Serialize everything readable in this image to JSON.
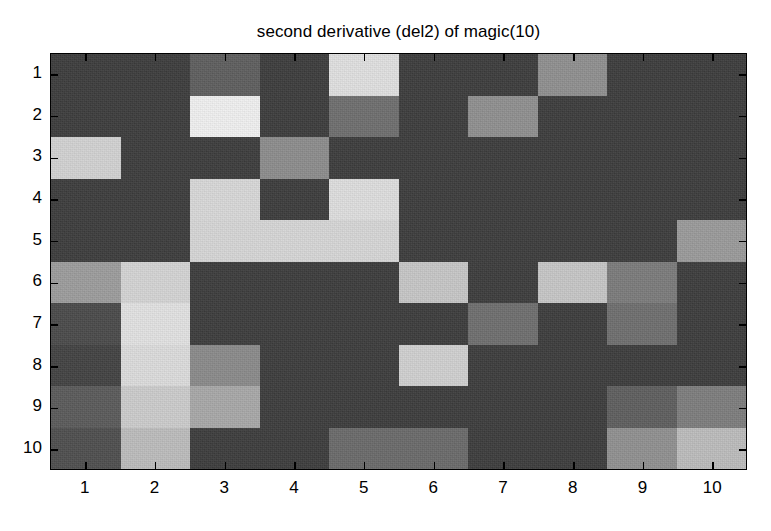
{
  "figure": {
    "title": "second derivative (del2) of magic(10)",
    "background": "#ffffff",
    "axis_color": "#000000"
  },
  "axes": {
    "x_tick_labels": [
      "1",
      "2",
      "3",
      "4",
      "5",
      "6",
      "7",
      "8",
      "9",
      "10"
    ],
    "y_tick_labels": [
      "1",
      "2",
      "3",
      "4",
      "5",
      "6",
      "7",
      "8",
      "9",
      "10"
    ],
    "xlabel": "",
    "ylabel": ""
  },
  "palette": {
    "darkest": "#343434",
    "dark": "#3c3c3c",
    "dark_mid": "#4a4a4a",
    "mid": "#5e5e5e",
    "mid_light": "#8a8a8a",
    "light": "#b0b0b0",
    "lighter": "#c8c8c8",
    "lightest": "#e8e8e8",
    "white": "#f2f2f2"
  },
  "chart_data": {
    "type": "heatmap",
    "title": "second derivative (del2) of magic(10)",
    "xlabel": "",
    "ylabel": "",
    "x": [
      "1",
      "2",
      "3",
      "4",
      "5",
      "6",
      "7",
      "8",
      "9",
      "10"
    ],
    "y": [
      "1",
      "2",
      "3",
      "4",
      "5",
      "6",
      "7",
      "8",
      "9",
      "10"
    ],
    "xlim": [
      0.5,
      10.5
    ],
    "ylim": [
      0.5,
      10.5
    ],
    "grid": false,
    "legend": "none",
    "colormap": "gray",
    "origin": "upper",
    "value_range": [
      0,
      1
    ],
    "cell_colors": [
      [
        "#3c3c3c",
        "#3c3c3c",
        "#5e5e5e",
        "#3c3c3c",
        "#e0e0e0",
        "#3c3c3c",
        "#3c3c3c",
        "#8f8f8f",
        "#3c3c3c",
        "#3c3c3c"
      ],
      [
        "#3c3c3c",
        "#3c3c3c",
        "#f0f0f0",
        "#3c3c3c",
        "#6e6e6e",
        "#3c3c3c",
        "#8f8f8f",
        "#3c3c3c",
        "#3c3c3c",
        "#3c3c3c"
      ],
      [
        "#d2d2d2",
        "#3c3c3c",
        "#3c3c3c",
        "#8c8c8c",
        "#3c3c3c",
        "#3c3c3c",
        "#3c3c3c",
        "#3c3c3c",
        "#3c3c3c",
        "#3c3c3c"
      ],
      [
        "#3c3c3c",
        "#3c3c3c",
        "#d8d8d8",
        "#3c3c3c",
        "#dedede",
        "#3c3c3c",
        "#3c3c3c",
        "#3c3c3c",
        "#3c3c3c",
        "#3c3c3c"
      ],
      [
        "#3c3c3c",
        "#3c3c3c",
        "#d6d6d6",
        "#d6d6d6",
        "#d6d6d6",
        "#3c3c3c",
        "#3c3c3c",
        "#3c3c3c",
        "#3c3c3c",
        "#9a9a9a"
      ],
      [
        "#9c9c9c",
        "#d4d4d4",
        "#3c3c3c",
        "#3c3c3c",
        "#3c3c3c",
        "#c6c6c6",
        "#3c3c3c",
        "#c6c6c6",
        "#7b7b7b",
        "#3c3c3c"
      ],
      [
        "#4a4a4a",
        "#e2e2e2",
        "#3c3c3c",
        "#3c3c3c",
        "#3c3c3c",
        "#3c3c3c",
        "#6e6e6e",
        "#3c3c3c",
        "#6e6e6e",
        "#3c3c3c"
      ],
      [
        "#424242",
        "#dcdcdc",
        "#8a8a8a",
        "#3c3c3c",
        "#3c3c3c",
        "#d0d0d0",
        "#3c3c3c",
        "#3c3c3c",
        "#3c3c3c",
        "#3c3c3c"
      ],
      [
        "#5a5a5a",
        "#cccccc",
        "#a8a8a8",
        "#3c3c3c",
        "#3c3c3c",
        "#3c3c3c",
        "#3c3c3c",
        "#3c3c3c",
        "#5e5e5e",
        "#7d7d7d"
      ],
      [
        "#4e4e4e",
        "#bcbcbc",
        "#3c3c3c",
        "#3c3c3c",
        "#6a6a6a",
        "#6a6a6a",
        "#3c3c3c",
        "#3c3c3c",
        "#909090",
        "#bcbcbc"
      ]
    ]
  }
}
